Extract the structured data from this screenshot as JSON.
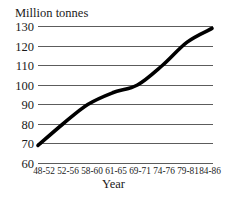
{
  "chart_data": {
    "type": "line",
    "title": "Million tonnes",
    "xlabel": "Year",
    "ylabel": "Million tonnes",
    "categories": [
      "48-52",
      "52-56",
      "58-60",
      "61-65",
      "69-71",
      "74-76",
      "79-81",
      "84-86"
    ],
    "values": [
      69,
      80,
      90,
      96,
      100,
      110,
      122,
      129
    ],
    "series": [
      {
        "name": "Million tonnes",
        "values": [
          69,
          80,
          90,
          96,
          100,
          110,
          122,
          129
        ]
      }
    ],
    "ylim": [
      60,
      130
    ],
    "yticks": [
      60,
      70,
      80,
      90,
      100,
      110,
      120,
      130
    ],
    "ytick_labels": [
      "60",
      "70",
      "80",
      "90",
      "100",
      "110",
      "120",
      "130"
    ],
    "grid": true,
    "legend": "none",
    "line_color": "#000000",
    "grid_color": "#4a4a4a"
  },
  "axes": {
    "y_title": "Million tonnes",
    "x_title": "Year"
  }
}
